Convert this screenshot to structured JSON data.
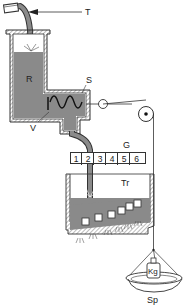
{
  "diagram": {
    "labels": {
      "T": "T",
      "R": "R",
      "S": "S",
      "V": "V",
      "G": "G",
      "Tr": "Tr",
      "Sp": "Sp",
      "weight": "Kg"
    },
    "gauge_cells": [
      "1",
      "2",
      "3",
      "4",
      "5",
      "6"
    ],
    "colors": {
      "fluid": "#8a8a8a",
      "outline": "#333333",
      "hatch": "#555555",
      "background": "#ffffff"
    }
  }
}
